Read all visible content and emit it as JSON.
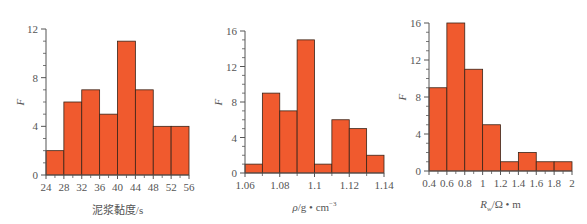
{
  "colors": {
    "bar_fill": "#f05a2e",
    "bar_stroke": "#3a2418",
    "axis": "#555555",
    "text": "#555555"
  },
  "chart_data": [
    {
      "type": "bar",
      "title": "",
      "xlabel": "泥浆黏度/s",
      "ylabel": "F",
      "bin_edges": [
        24,
        28,
        32,
        36,
        40,
        44,
        48,
        52,
        56
      ],
      "categories": [
        "24-28",
        "28-32",
        "32-36",
        "36-40",
        "40-44",
        "44-48",
        "48-52",
        "52-56"
      ],
      "values": [
        2,
        6,
        7,
        5,
        11,
        7,
        4,
        4
      ],
      "xticks": [
        "24",
        "28",
        "32",
        "36",
        "40",
        "44",
        "48",
        "52",
        "56"
      ],
      "yticks": [
        "0",
        "4",
        "8",
        "12"
      ],
      "xlim": [
        24,
        56
      ],
      "ylim": [
        0,
        12
      ],
      "grid": false,
      "legend": null
    },
    {
      "type": "bar",
      "title": "",
      "xlabel": "ρ/g • cm⁻³",
      "ylabel": "F",
      "bin_edges": [
        1.06,
        1.07,
        1.08,
        1.09,
        1.1,
        1.11,
        1.12,
        1.13,
        1.14
      ],
      "categories": [
        "1.06-1.07",
        "1.07-1.08",
        "1.08-1.09",
        "1.09-1.10",
        "1.10-1.11",
        "1.11-1.12",
        "1.12-1.13",
        "1.13-1.14"
      ],
      "values": [
        1,
        9,
        7,
        15,
        1,
        6,
        5,
        2
      ],
      "xticks": [
        "1.06",
        "1.08",
        "1.1",
        "1.12",
        "1.14"
      ],
      "yticks": [
        "0",
        "4",
        "8",
        "12",
        "16"
      ],
      "xlim": [
        1.06,
        1.14
      ],
      "ylim": [
        0,
        16
      ],
      "grid": false,
      "legend": null
    },
    {
      "type": "bar",
      "title": "",
      "xlabel": "Rw/Ω • m",
      "ylabel": "F",
      "bin_edges": [
        0.4,
        0.6,
        0.8,
        1.0,
        1.2,
        1.4,
        1.6,
        1.8,
        2.0
      ],
      "categories": [
        "0.4-0.6",
        "0.6-0.8",
        "0.8-1.0",
        "1.0-1.2",
        "1.2-1.4",
        "1.4-1.6",
        "1.6-1.8",
        "1.8-2.0"
      ],
      "values": [
        9,
        16,
        11,
        5,
        1,
        2,
        1,
        1
      ],
      "xticks": [
        "0.4",
        "0.6",
        "0.8",
        "1",
        "1.2",
        "1.4",
        "1.6",
        "1.8",
        "2"
      ],
      "yticks": [
        "0",
        "4",
        "8",
        "12",
        "16"
      ],
      "xlim": [
        0.4,
        2.0
      ],
      "ylim": [
        0,
        16
      ],
      "grid": false,
      "legend": null
    }
  ],
  "layout": [
    {
      "x0": 46,
      "x1": 189,
      "y0": 175,
      "y1": 29,
      "ylab_x": 20,
      "xlabel_y": 214,
      "minor_x": 2,
      "minor_y": 4
    },
    {
      "x0": 245,
      "x1": 384,
      "y0": 173,
      "y1": 31,
      "ylab_x": 218,
      "xlabel_y": 211,
      "minor_x": 2,
      "minor_y": 4
    },
    {
      "x0": 429,
      "x1": 572,
      "y0": 171,
      "y1": 23,
      "ylab_x": 402,
      "xlabel_y": 208,
      "minor_x": 2,
      "minor_y": 4
    }
  ]
}
